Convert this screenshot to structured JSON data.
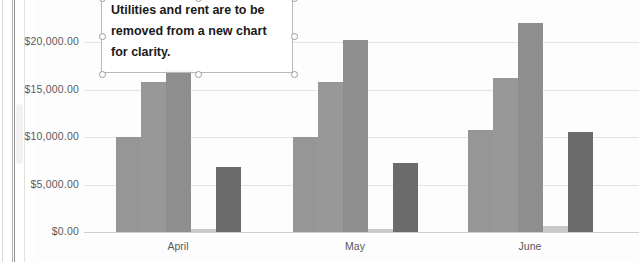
{
  "chart_data": {
    "type": "bar",
    "title": "",
    "xlabel": "",
    "ylabel": "",
    "categories": [
      "April",
      "May",
      "June"
    ],
    "ylim": [
      0,
      25000
    ],
    "yticks": [
      "$0.00",
      "$5,000.00",
      "$10,000.00",
      "$15,000.00",
      "$20,000.00",
      "$25,000.00"
    ],
    "ytick_values": [
      0,
      5000,
      10000,
      15000,
      20000,
      25000
    ],
    "grid": true,
    "legend": "none",
    "series": [
      {
        "name": "Series 1",
        "color": "#969696",
        "values": [
          10000,
          10000,
          10800
        ]
      },
      {
        "name": "Series 2",
        "color": "#989898",
        "values": [
          15800,
          15800,
          16200
        ]
      },
      {
        "name": "Series 3",
        "color": "#8e8e8e",
        "values": [
          17100,
          20300,
          22100
        ]
      },
      {
        "name": "Series 4",
        "color": "#c9c9c9",
        "values": [
          350,
          350,
          600
        ]
      },
      {
        "name": "Series 5",
        "color": "#6b6b6b",
        "values": [
          6900,
          7300,
          10500
        ]
      }
    ]
  },
  "textbox": {
    "text": "Utilities and rent are to be removed from a new chart for clarity.",
    "selected": true,
    "handles": [
      "top-left",
      "top-middle",
      "top-right",
      "middle-left",
      "middle-right",
      "bottom-left",
      "bottom-middle",
      "bottom-right"
    ]
  },
  "colors": {
    "gridline": "#e4e4e4",
    "baseline": "#cfcfcf",
    "axis_text": "#5a5a5a",
    "textbox_border": "#b9b9b9",
    "handle_border": "#9a9a9a"
  }
}
